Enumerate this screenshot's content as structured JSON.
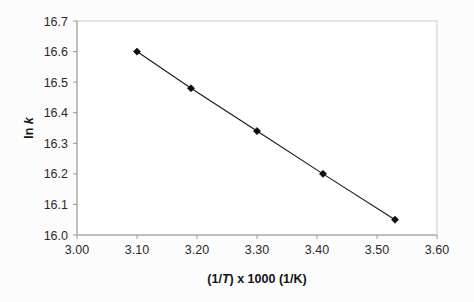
{
  "chart_data": {
    "type": "line",
    "title": "",
    "subtitle": "",
    "xlabel": "(1/T) x 1000 (1/K)",
    "xlabel_parts": {
      "prefix": "(1/",
      "italic": "T",
      "suffix": ") x 1000 (1/K)"
    },
    "ylabel": "ln k",
    "ylabel_parts": {
      "prefix": "ln ",
      "italic": "k"
    },
    "x": [
      3.1,
      3.19,
      3.3,
      3.41,
      3.53
    ],
    "values": [
      16.6,
      16.48,
      16.34,
      16.2,
      16.05
    ],
    "series": [
      {
        "name": "ln k vs (1/T) x 1000",
        "x": [
          3.1,
          3.19,
          3.3,
          3.41,
          3.53
        ],
        "values": [
          16.6,
          16.48,
          16.34,
          16.2,
          16.05
        ]
      }
    ],
    "xlim": [
      3.0,
      3.6
    ],
    "ylim": [
      16.0,
      16.7
    ],
    "xticks": [
      3.0,
      3.1,
      3.2,
      3.3,
      3.4,
      3.5,
      3.6
    ],
    "yticks": [
      16.0,
      16.1,
      16.2,
      16.3,
      16.4,
      16.5,
      16.6,
      16.7
    ],
    "xtick_labels": [
      "3.00",
      "3.10",
      "3.20",
      "3.30",
      "3.40",
      "3.50",
      "3.60"
    ],
    "ytick_labels": [
      "16.0",
      "16.1",
      "16.2",
      "16.3",
      "16.4",
      "16.5",
      "16.6",
      "16.7"
    ],
    "grid": false,
    "legend": false,
    "legend_position": "none",
    "marker": "diamond",
    "marker_color": "#0d0d0d",
    "line_color": "#1b1b1b",
    "plot_background": "#ffffff",
    "border_color": "#c9c9c9"
  }
}
